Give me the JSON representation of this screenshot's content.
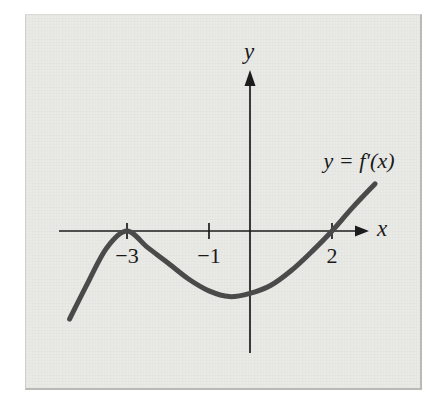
{
  "colors": {
    "page_background": "#ffffff",
    "panel_background": "#e9e9e6",
    "panel_border": "#b9b9b6",
    "axis": "#1c1c1c",
    "curve": "#4a4a4a",
    "text": "#1a1a1a"
  },
  "labels": {
    "x_axis": "x",
    "y_axis": "y",
    "curve": "y = f′(x)"
  },
  "chart_data": {
    "type": "line",
    "title": "",
    "xlabel": "x",
    "ylabel": "y",
    "grid": false,
    "legend_position": "none",
    "x_range": [
      -4.6,
      3.4
    ],
    "y_range": [
      -3.0,
      3.9
    ],
    "x_ticks": [
      {
        "value": -3,
        "label": "−3"
      },
      {
        "value": -1,
        "label": "−1"
      },
      {
        "value": 2,
        "label": "2"
      }
    ],
    "series": [
      {
        "name": "y = f′(x)",
        "x": [
          -4.4,
          -4.0,
          -3.5,
          -3.0,
          -2.5,
          -2.0,
          -1.5,
          -1.0,
          -0.5,
          0.0,
          0.5,
          1.0,
          1.5,
          2.0,
          2.5,
          3.05
        ],
        "y": [
          -2.15,
          -1.35,
          -0.42,
          0.0,
          -0.4,
          -0.78,
          -1.17,
          -1.46,
          -1.6,
          -1.52,
          -1.33,
          -0.97,
          -0.51,
          0.0,
          0.57,
          1.15
        ]
      }
    ],
    "curve_features": {
      "touches_x_axis_at": -3,
      "local_minimum": {
        "x": -0.5,
        "y": -1.6
      },
      "crosses_x_axis_at": 2
    }
  }
}
